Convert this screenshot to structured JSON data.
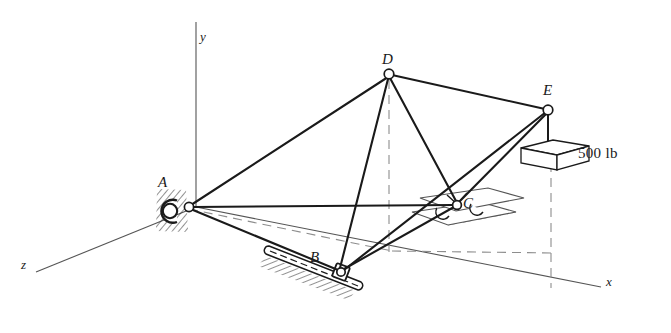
{
  "figure": {
    "background_color": "#ffffff",
    "line_color": "#1a1a1a",
    "axis_color": "#4a4a4a",
    "dashed_color": "#8a8a8a",
    "joint_fill": "#ffffff"
  },
  "axes": [
    {
      "name": "y",
      "label": "y",
      "label_x": 200,
      "label_y": 30,
      "x1": 196,
      "y1": 22,
      "x2": 196,
      "y2": 207
    },
    {
      "name": "x",
      "label": "x",
      "label_x": 606,
      "label_y": 275,
      "x1": 196,
      "y1": 207,
      "x2": 601,
      "y2": 287
    },
    {
      "name": "z",
      "label": "z",
      "label_x": 22,
      "label_y": 258,
      "x1": 196,
      "y1": 207,
      "x2": 36,
      "y2": 272
    }
  ],
  "joints": [
    {
      "name": "A",
      "label": "A",
      "x": 189,
      "y": 207,
      "label_x": 158,
      "label_y": 174,
      "support": "ball-and-socket"
    },
    {
      "name": "B",
      "label": "B",
      "x": 341,
      "y": 272,
      "label_x": 310,
      "label_y": 250,
      "support": "collar-on-rod"
    },
    {
      "name": "C",
      "label": "C",
      "x": 457,
      "y": 205,
      "label_x": 463,
      "label_y": 196,
      "support": "rollers-on-plane"
    },
    {
      "name": "D",
      "label": "D",
      "x": 389,
      "y": 74,
      "label_x": 382,
      "label_y": 52,
      "support": "free"
    },
    {
      "name": "E",
      "label": "E",
      "x": 548,
      "y": 110,
      "label_x": 543,
      "label_y": 83,
      "support": "loaded"
    }
  ],
  "members": [
    {
      "name": "member-AD",
      "from": "A",
      "to": "D"
    },
    {
      "name": "member-AC",
      "from": "A",
      "to": "C"
    },
    {
      "name": "member-AB",
      "from": "A",
      "to": "B"
    },
    {
      "name": "member-BD",
      "from": "B",
      "to": "D"
    },
    {
      "name": "member-BE",
      "from": "B",
      "to": "E"
    },
    {
      "name": "member-BC",
      "from": "B",
      "to": "C"
    },
    {
      "name": "member-CD",
      "from": "C",
      "to": "D"
    },
    {
      "name": "member-CE",
      "from": "C",
      "to": "E"
    },
    {
      "name": "member-DE",
      "from": "D",
      "to": "E"
    }
  ],
  "hidden_lines": [
    {
      "name": "projection-A-to-B-base",
      "x1": 189,
      "y1": 209,
      "x2": 392,
      "y2": 251
    },
    {
      "name": "projection-base-to-E",
      "x1": 392,
      "y1": 251,
      "x2": 553,
      "y2": 253
    },
    {
      "name": "projection-D-vertical",
      "x1": 389,
      "y1": 78,
      "x2": 389,
      "y2": 250
    },
    {
      "name": "projection-E-vertical",
      "x1": 551,
      "y1": 162,
      "x2": 551,
      "y2": 287
    }
  ],
  "load": {
    "name": "weight-500lb",
    "label": "500 lb",
    "label_x": 578,
    "label_y": 146,
    "cord_x1": 548,
    "cord_y1": 112,
    "cord_x2": 548,
    "cord_y2": 157,
    "block_top_face": "521,148 553,140 589,146 557,155",
    "block_front_face": "521,148 557,155 557,170 521,163",
    "block_side_face": "557,155 589,146 589,161 557,170"
  },
  "supports": {
    "ball_socket": {
      "name": "ball-and-socket-support-A",
      "socket_cx": 170,
      "socket_cy": 211,
      "socket_r": 11,
      "ball_cx": 189,
      "ball_cy": 207,
      "ball_r": 5,
      "hatch_count": 14
    },
    "collar": {
      "name": "collar-support-B",
      "rod_x1": 268,
      "rod_y1": 249,
      "rod_x2": 360,
      "rod_y2": 285,
      "collar_x": 341,
      "collar_y": 272,
      "hatch_count": 13
    },
    "rollers": {
      "name": "roller-support-C",
      "plate_top": "420,198 488,188 524,198 456,211",
      "plate_bottom": "412,212 480,202 516,212 448,225",
      "roller1_cx": 443,
      "roller1_cy": 213,
      "roller2_cx": 477,
      "roller2_cy": 209,
      "roller_r": 6,
      "bracket": "448,194 457,203 466,193"
    }
  }
}
